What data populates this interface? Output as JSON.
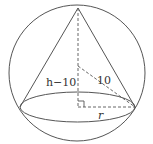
{
  "diagram": {
    "type": "sphere-inscribed-cone",
    "labels": {
      "height_segment": "h−10",
      "radius_segment": "10",
      "base_radius": "r"
    },
    "colors": {
      "stroke": "#555555",
      "background": "#ffffff",
      "text": "#333333"
    }
  }
}
